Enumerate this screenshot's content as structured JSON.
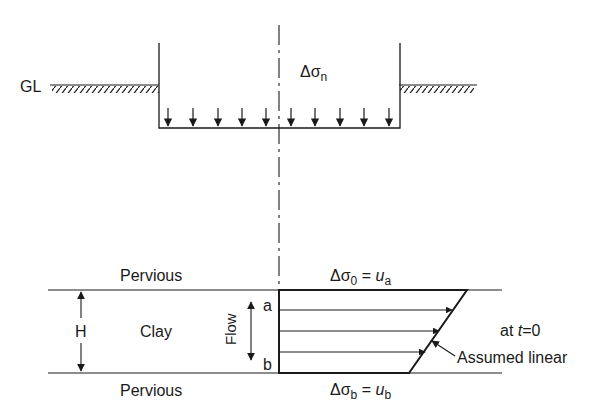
{
  "diagram": {
    "ground_label": "GL",
    "load_label": {
      "main": "Δσ",
      "sub": "n"
    },
    "top_layer_label": "Pervious",
    "bottom_layer_label": "Pervious",
    "clay_label": "Clay",
    "thickness_label": "H",
    "flow_label": "Flow",
    "point_a": "a",
    "point_b": "b",
    "top_stress": {
      "main": "Δσ",
      "sub": "0",
      "eq": " = ",
      "u": "u",
      "usub": "a"
    },
    "bottom_stress": {
      "main": "Δσ",
      "sub": "b",
      "eq": " = ",
      "u": "u",
      "usub": "b"
    },
    "time_label": {
      "prefix": "at ",
      "var": "t",
      "suffix": "=0"
    },
    "annotation": "Assumed linear",
    "line_color": "#1a1a1a"
  }
}
